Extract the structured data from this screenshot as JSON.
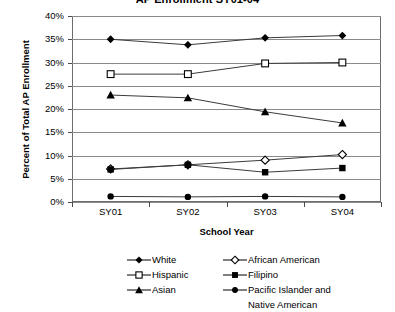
{
  "chart_data": {
    "type": "line",
    "title": "AP Enrollment SY01-04",
    "xlabel": "School Year",
    "ylabel": "Percent of Total AP Enrollment",
    "categories": [
      "SY01",
      "SY02",
      "SY03",
      "SY04"
    ],
    "ylim": [
      0,
      40
    ],
    "ytick_values": [
      0,
      5,
      10,
      15,
      20,
      25,
      30,
      35,
      40
    ],
    "ytick_labels": [
      "0%",
      "5%",
      "10%",
      "15%",
      "20%",
      "25%",
      "30%",
      "35%",
      "40%"
    ],
    "grid": true,
    "legend_position": "bottom",
    "series": [
      {
        "name": "White",
        "marker": "filled-diamond",
        "values": [
          35.0,
          33.8,
          35.3,
          35.8
        ]
      },
      {
        "name": "African American",
        "marker": "open-diamond",
        "values": [
          7.1,
          8.0,
          9.0,
          10.2
        ]
      },
      {
        "name": "Hispanic",
        "marker": "open-square",
        "values": [
          27.5,
          27.5,
          29.8,
          30.0
        ]
      },
      {
        "name": "Filipino",
        "marker": "filled-square",
        "values": [
          7.0,
          8.0,
          6.4,
          7.3
        ]
      },
      {
        "name": "Asian",
        "marker": "filled-triangle",
        "values": [
          23.0,
          22.4,
          19.4,
          17.0
        ]
      },
      {
        "name": "Pacific Islander and Native American",
        "marker": "filled-circle",
        "values": [
          1.2,
          1.1,
          1.2,
          1.1
        ]
      }
    ]
  },
  "legend": {
    "rows": [
      {
        "left": "White",
        "right": "African American"
      },
      {
        "left": "Hispanic",
        "right": "Filipino"
      },
      {
        "left": "Asian",
        "right": "Pacific Islander and",
        "right_continuation": "Native American"
      }
    ]
  },
  "colors": {
    "line": "#3b3b3b",
    "marker": "#000000",
    "grid": "#8a8a8a",
    "axis": "#6d6d6d",
    "background": "#ffffff"
  }
}
